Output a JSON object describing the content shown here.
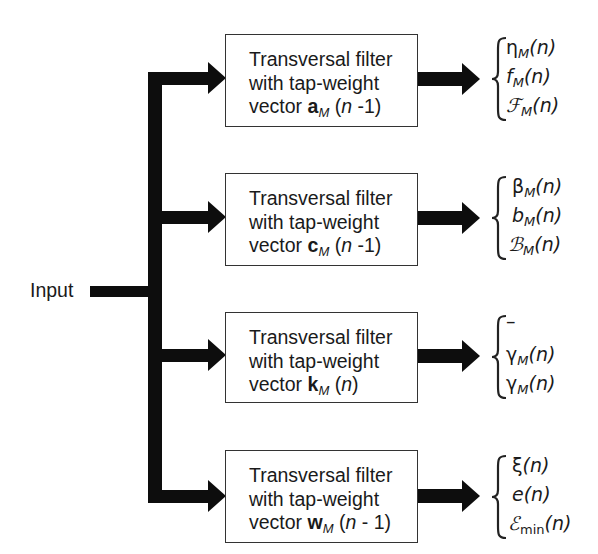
{
  "diagram": {
    "input_label": "Input",
    "filters": [
      {
        "line1": "Transversal filter",
        "line2": "with tap-weight",
        "line3_prefix": "vector ",
        "vector_symbol": "a",
        "vector_subscript": "M",
        "arg_open": " (",
        "arg_var": "n",
        "arg_rest": " -1)",
        "outputs": [
          {
            "symbol": "η",
            "sub": "M",
            "arg": "(n)"
          },
          {
            "symbol": "f",
            "sub": "M",
            "arg": "(n)"
          },
          {
            "symbol": "ℱ",
            "sub": "M",
            "arg": "(n)"
          }
        ]
      },
      {
        "line1": "Transversal filter",
        "line2": "with tap-weight",
        "line3_prefix": "vector ",
        "vector_symbol": "c",
        "vector_subscript": "M",
        "arg_open": " (",
        "arg_var": "n",
        "arg_rest": " -1)",
        "outputs": [
          {
            "symbol": "β",
            "sub": "M",
            "arg": "(n)"
          },
          {
            "symbol": "b",
            "sub": "M",
            "arg": "(n)"
          },
          {
            "symbol": "ℬ",
            "sub": "M",
            "arg": "(n)"
          }
        ]
      },
      {
        "line1": "Transversal filter",
        "line2": "with tap-weight",
        "line3_prefix": "vector ",
        "vector_symbol": "k",
        "vector_subscript": "M",
        "arg_open": " (",
        "arg_var": "n",
        "arg_rest": ")",
        "outputs": [
          {
            "symbol": "–",
            "sub": "",
            "arg": ""
          },
          {
            "symbol": "γ",
            "sub": "M",
            "arg": "(n)"
          },
          {
            "symbol": "γ",
            "sub": "M",
            "arg": "(n)"
          }
        ]
      },
      {
        "line1": "Transversal filter",
        "line2": "with tap-weight",
        "line3_prefix": "vector ",
        "vector_symbol": "w",
        "vector_subscript": "M",
        "arg_open": " (",
        "arg_var": "n",
        "arg_rest": " - 1)",
        "outputs": [
          {
            "symbol": "ξ",
            "sub": "",
            "arg": "(n)"
          },
          {
            "symbol": "e",
            "sub": "",
            "arg": "(n)"
          },
          {
            "symbol": "ℰ",
            "sub": "min",
            "arg": "(n)"
          }
        ]
      }
    ]
  }
}
